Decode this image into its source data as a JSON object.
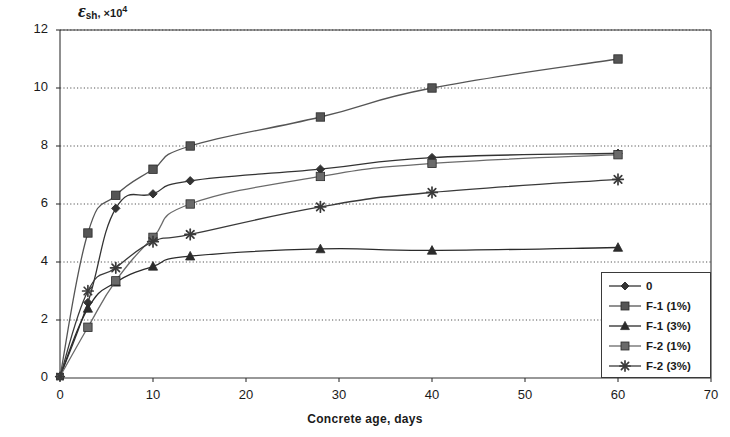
{
  "chart_data": {
    "type": "line",
    "title": "",
    "ylabel_parts": {
      "symbol": "ε",
      "subscript": "sh",
      "separator": ", ",
      "multiplier": "×10",
      "exponent": "4"
    },
    "ylabel": "εsh, ×10⁴",
    "xlabel": "Concrete age, days",
    "xlim": [
      0,
      70
    ],
    "ylim": [
      0,
      12
    ],
    "xticks": [
      0,
      10,
      20,
      30,
      40,
      50,
      60,
      70
    ],
    "yticks": [
      0,
      2,
      4,
      6,
      8,
      10,
      12
    ],
    "grid": "horizontal-dotted",
    "legend_position": "bottom-right",
    "x": [
      0,
      3,
      6,
      10,
      14,
      28,
      40,
      60
    ],
    "series": [
      {
        "name": "0",
        "marker": "diamond",
        "color": "#333333",
        "values": [
          0.05,
          2.6,
          5.85,
          6.35,
          6.8,
          7.2,
          7.6,
          7.75
        ]
      },
      {
        "name": "F-1 (1%)",
        "marker": "square",
        "color": "#555555",
        "values": [
          0.05,
          5.0,
          6.3,
          7.2,
          8.0,
          9.0,
          10.0,
          11.0
        ]
      },
      {
        "name": "F-1 (3%)",
        "marker": "triangle",
        "color": "#2b2b2b",
        "values": [
          0.05,
          2.4,
          3.3,
          3.85,
          4.2,
          4.45,
          4.4,
          4.5
        ]
      },
      {
        "name": "F-2 (1%)",
        "marker": "square",
        "color": "#6a6a6a",
        "values": [
          0.05,
          1.75,
          3.35,
          4.85,
          6.0,
          6.95,
          7.4,
          7.7
        ]
      },
      {
        "name": "F-2 (3%)",
        "marker": "star",
        "color": "#3a3a3a",
        "values": [
          0.05,
          3.0,
          3.8,
          4.7,
          4.95,
          5.9,
          6.4,
          6.85
        ]
      }
    ]
  },
  "legend": {
    "items": [
      {
        "label": "0",
        "marker": "diamond"
      },
      {
        "label": "F-1 (1%)",
        "marker": "square"
      },
      {
        "label": "F-1 (3%)",
        "marker": "triangle"
      },
      {
        "label": "F-2 (1%)",
        "marker": "square"
      },
      {
        "label": "F-2 (3%)",
        "marker": "star"
      }
    ]
  },
  "axes": {
    "x_tick_labels": [
      "0",
      "10",
      "20",
      "30",
      "40",
      "50",
      "60",
      "70"
    ],
    "y_tick_labels": [
      "0",
      "2",
      "4",
      "6",
      "8",
      "10",
      "12"
    ],
    "x_axis_title": "Concrete age, days"
  }
}
